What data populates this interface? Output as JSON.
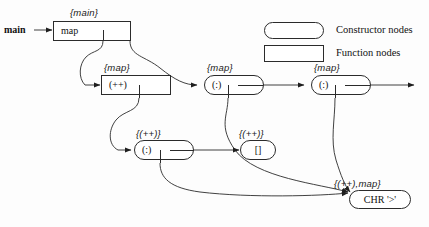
{
  "diagram": {
    "title_entry": "main",
    "background_color": "#fdfdfd",
    "line_color": "#2b2b2b",
    "nodes": [
      {
        "id": "map",
        "label": "map",
        "tag": "{main}",
        "shape": "function"
      },
      {
        "id": "plus",
        "label": "(++)",
        "tag": "{map}",
        "shape": "function"
      },
      {
        "id": "cons1",
        "label": "(:)",
        "tag": "{map}",
        "shape": "constructor"
      },
      {
        "id": "cons2",
        "label": "(:)",
        "tag": "{map}",
        "shape": "constructor"
      },
      {
        "id": "cons3",
        "label": "(:)",
        "tag": "{(++)}",
        "shape": "constructor"
      },
      {
        "id": "nil",
        "label": "[]",
        "tag": "{(++)}",
        "shape": "constructor"
      },
      {
        "id": "chr",
        "label": "CHR '>'",
        "tag": "{(++),map}",
        "shape": "constructor"
      }
    ]
  },
  "legend": {
    "items": [
      {
        "shape": "constructor",
        "label": "Constructor nodes"
      },
      {
        "shape": "function",
        "label": "Function nodes"
      }
    ]
  }
}
